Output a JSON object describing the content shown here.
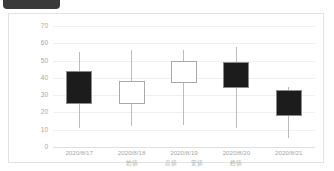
{
  "window": {
    "tab_label": ""
  },
  "chart_data": {
    "type": "candlestick",
    "title": "",
    "subtitle": "",
    "xlabel": "",
    "ylabel": "",
    "ylim": [
      0,
      70
    ],
    "yticks": [
      0,
      10,
      20,
      30,
      40,
      50,
      60,
      70
    ],
    "grid": true,
    "legend_position": "below-axis",
    "categories": [
      "2020/8/17",
      "2020/8/18",
      "2020/8/19",
      "2020/8/20",
      "2020/8/21"
    ],
    "series_terms": [
      "始値",
      "高値",
      "安値",
      "終値"
    ],
    "colors": {
      "up_fill": "#ffffff",
      "down_fill": "#1c1c1c",
      "border": "#aaaaaa",
      "wick": "#bdbdbd",
      "grid": "#f0f0f0",
      "tick_text": "#a8a8a8",
      "frame": "#e3e3e3",
      "tab": "#3a3a3a"
    },
    "points": [
      {
        "date": "2020/8/17",
        "open": 44,
        "high": 55,
        "low": 11,
        "close": 25,
        "direction": "down"
      },
      {
        "date": "2020/8/18",
        "open": 25,
        "high": 56,
        "low": 12,
        "close": 38,
        "direction": "up"
      },
      {
        "date": "2020/8/19",
        "open": 37,
        "high": 56,
        "low": 13,
        "close": 50,
        "direction": "up"
      },
      {
        "date": "2020/8/20",
        "open": 49,
        "high": 58,
        "low": 11,
        "close": 34,
        "direction": "down"
      },
      {
        "date": "2020/8/21",
        "open": 33,
        "high": 35,
        "low": 5,
        "close": 18,
        "direction": "down"
      }
    ]
  }
}
